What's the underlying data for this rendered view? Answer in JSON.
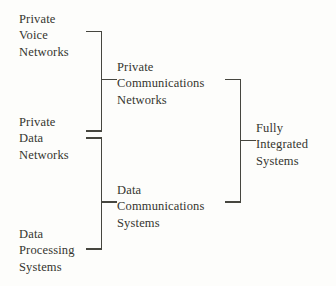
{
  "diagram": {
    "type": "bracket-tree",
    "title": "",
    "levels": [
      {
        "name": "inputs",
        "nodes": [
          {
            "id": "private-voice-networks",
            "lines": [
              "Private",
              "Voice",
              "Networks"
            ]
          },
          {
            "id": "private-data-networks",
            "lines": [
              "Private",
              "Data",
              "Networks"
            ]
          },
          {
            "id": "data-processing-systems",
            "lines": [
              "Data",
              "Processing",
              "Systems"
            ]
          }
        ]
      },
      {
        "name": "intermediate",
        "nodes": [
          {
            "id": "private-communications-networks",
            "lines": [
              "Private",
              "Communications",
              "Networks"
            ]
          },
          {
            "id": "data-communications-systems",
            "lines": [
              "Data",
              "Communications",
              "Systems"
            ]
          }
        ]
      },
      {
        "name": "output",
        "nodes": [
          {
            "id": "fully-integrated-systems",
            "lines": [
              "Fully",
              "Integrated",
              "Systems"
            ]
          }
        ]
      }
    ],
    "groupings": [
      {
        "id": "bracket-upper-left",
        "members": [
          "private-voice-networks",
          "private-data-networks"
        ],
        "produces": "private-communications-networks"
      },
      {
        "id": "bracket-lower-left",
        "members": [
          "private-data-networks",
          "data-processing-systems"
        ],
        "produces": "data-communications-systems"
      },
      {
        "id": "bracket-right",
        "members": [
          "private-communications-networks",
          "data-communications-systems"
        ],
        "produces": "fully-integrated-systems"
      }
    ],
    "colors": {
      "ink": "#46463f",
      "text": "#35352f",
      "paper": "#fdfdfb"
    }
  }
}
